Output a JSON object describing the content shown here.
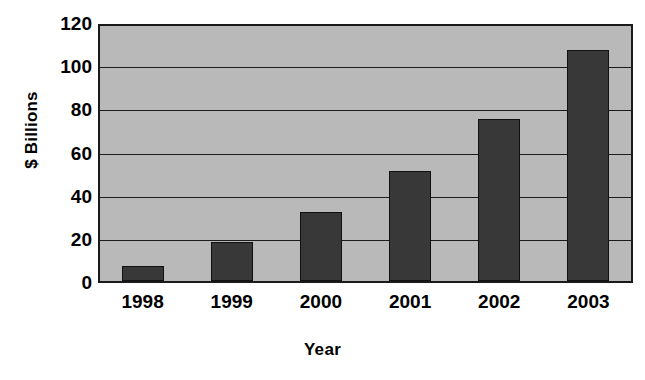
{
  "chart_data": {
    "type": "bar",
    "title": "",
    "subtitle": "",
    "xlabel": "Year",
    "ylabel": "$ Billions",
    "categories": [
      "1998",
      "1999",
      "2000",
      "2001",
      "2002",
      "2003"
    ],
    "values": [
      7,
      18,
      32,
      51,
      75,
      107
    ],
    "ylim": [
      0,
      120
    ],
    "y_ticks": [
      0,
      20,
      40,
      60,
      80,
      100,
      120
    ],
    "y_tick_labels": [
      "0",
      "20",
      "40",
      "60",
      "80",
      "100",
      "120"
    ],
    "grid": "horizontal",
    "legend": "none",
    "series": [
      {
        "name": "$ Billions",
        "values": [
          7,
          18,
          32,
          51,
          75,
          107
        ]
      }
    ],
    "colors": {
      "bar_fill": "#383838",
      "bar_border": "#111111",
      "plot_background": "#b9b9b9",
      "axis_line": "#1a1a1a",
      "gridline": "#1c1c1c",
      "text": "#000000",
      "figure_background": "#ffffff"
    }
  },
  "axes": {
    "y_title": "$ Billions",
    "x_title": "Year"
  }
}
